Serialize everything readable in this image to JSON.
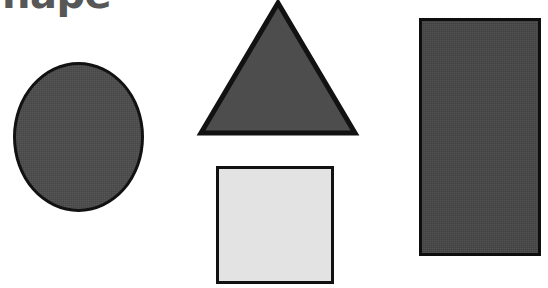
{
  "page": {
    "background_color": "#ffffff",
    "width": 548,
    "height": 288
  },
  "heading": {
    "visible_text": "hape",
    "color": "#575757",
    "note_clipped": "top of text cropped by image edge"
  },
  "shapes": [
    {
      "name": "circle",
      "label": "circle",
      "fill": "#4b4b4b",
      "stroke": "#121212",
      "x": 13,
      "y": 62,
      "width": 131,
      "height": 150
    },
    {
      "name": "triangle",
      "label": "triangle",
      "fill": "#4d4d4d",
      "stroke": "#121212",
      "apex_x": 278,
      "apex_y": 2,
      "base_left_x": 200,
      "base_right_x": 355,
      "base_y": 133
    },
    {
      "name": "square",
      "label": "square",
      "fill": "#e3e3e3",
      "stroke": "#111111",
      "x": 216,
      "y": 166,
      "width": 118,
      "height": 118
    },
    {
      "name": "rectangle",
      "label": "rectangle",
      "fill": "#454545",
      "stroke": "#0e0e0e",
      "x": 419,
      "y": 18,
      "width": 122,
      "height": 238
    }
  ]
}
